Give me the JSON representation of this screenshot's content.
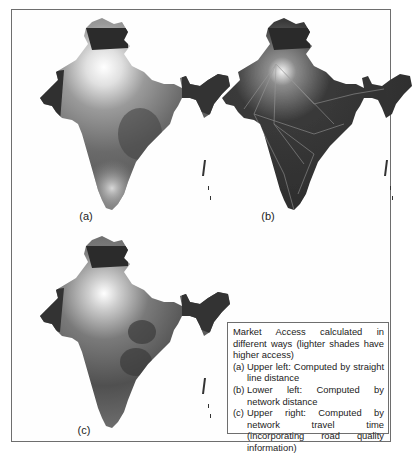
{
  "figure": {
    "panels": [
      {
        "id": "a",
        "label": "(a)",
        "position": "upper-left",
        "description": "Market access computed by straight line distance"
      },
      {
        "id": "b",
        "label": "(b)",
        "position": "upper-right",
        "description": "Market access computed by network travel time"
      },
      {
        "id": "c",
        "label": "(c)",
        "position": "lower-left",
        "description": "Market access computed by network distance"
      }
    ],
    "caption": {
      "intro": "Market Access calculated in different ways (lighter shades have higher access)",
      "items": [
        {
          "tag": "(a)",
          "text": "Upper left: Computed by straight line distance"
        },
        {
          "tag": "(b)",
          "text": "Lower left: Computed by network distance"
        },
        {
          "tag": "(c)",
          "text": "Upper right: Computed by network travel time (incorporating road quality information)"
        }
      ]
    },
    "colors": {
      "dark": "#2a2a2a",
      "mid": "#6a6a6a",
      "light": "#ffffff",
      "border": "#6e6e6e"
    }
  }
}
